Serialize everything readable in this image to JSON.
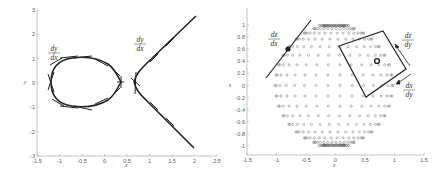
{
  "figure": {
    "left_panel": {
      "xlabel": "x",
      "ylabel": "y",
      "xticks": [
        "-1.5",
        "-1",
        "-0.5",
        "0",
        "0.5",
        "1",
        "1.5",
        "2",
        "2.5"
      ],
      "yticks": [
        "3",
        "2",
        "1",
        "0",
        "-1",
        "-2",
        "-3"
      ],
      "annotations": [
        {
          "num": "dy",
          "den": "dx",
          "position": "near closed loop"
        },
        {
          "num": "dy",
          "den": "dx",
          "position": "near open branch"
        }
      ]
    },
    "right_panel": {
      "xlabel": "x",
      "ylabel": "z",
      "xticks": [
        "-1.5",
        "-1",
        "-0.5",
        "0",
        "0.5",
        "1",
        "1.5"
      ],
      "yticks": [
        "1",
        "0.8",
        "0.6",
        "0.4",
        "0.2",
        "0",
        "-0.2",
        "-0.4",
        "-0.6",
        "-0.8",
        "-1"
      ],
      "annotations": [
        {
          "num": "dz",
          "den": "dx",
          "position": "tangent line upper-left"
        },
        {
          "num": "dz",
          "den": "dy",
          "position": "tangent plane upper-right"
        },
        {
          "num": "dx",
          "den": "dy",
          "position": "tangent plane lower-right"
        }
      ]
    }
  },
  "chart_data": [
    {
      "type": "line",
      "title": "",
      "xlabel": "x",
      "ylabel": "y",
      "xlim": [
        -1.5,
        2.5
      ],
      "ylim": [
        -3,
        3
      ],
      "grid": false,
      "description": "Elliptic-type curve with closed oval (x from about -1.15 to 0.4, y from -0.85 to 0.85) and open branch starting at x about 0.8 extending to (2.1, +/-2.7), with short tangent segments drawn along the curve",
      "series": [
        {
          "name": "closed oval",
          "x": [
            -1.15,
            -1.0,
            -0.75,
            -0.5,
            -0.25,
            0,
            0.25,
            0.4,
            0.25,
            0,
            -0.25,
            -0.5,
            -0.75,
            -1.0,
            -1.15
          ],
          "y": [
            0,
            0.55,
            0.78,
            0.82,
            0.75,
            0.6,
            0.3,
            0,
            -0.3,
            -0.6,
            -0.75,
            -0.82,
            -0.78,
            -0.55,
            0
          ]
        },
        {
          "name": "open branch upper",
          "x": [
            0.8,
            0.9,
            1.2,
            1.5,
            1.8,
            2.1
          ],
          "y": [
            0,
            0.4,
            0.95,
            1.5,
            2.1,
            2.7
          ]
        },
        {
          "name": "open branch lower",
          "x": [
            0.8,
            0.9,
            1.2,
            1.5,
            1.8,
            2.1
          ],
          "y": [
            0,
            -0.4,
            -0.95,
            -1.5,
            -2.1,
            -2.7
          ]
        }
      ],
      "annotations": [
        "dy/dx",
        "dy/dx"
      ]
    },
    {
      "type": "scatter",
      "title": "",
      "xlabel": "x",
      "ylabel": "z",
      "xlim": [
        -1.5,
        1.5
      ],
      "ylim": [
        -1.1,
        1.1
      ],
      "grid": false,
      "description": "Points on a unit sphere projected onto the x-z plane (circle markers); highlighted point near (-0.8, 0.6) with tangent line, highlighted point near (0.7, 0.4) with tangent square/plane and arrows",
      "series": [
        {
          "name": "sphere points",
          "marker": "circle",
          "extent": {
            "x": [
              -1,
              1
            ],
            "z": [
              -1,
              1
            ]
          }
        },
        {
          "name": "highlight 1",
          "x": [
            -0.8
          ],
          "y": [
            0.6
          ]
        },
        {
          "name": "highlight 2",
          "x": [
            0.7
          ],
          "y": [
            0.4
          ]
        }
      ],
      "annotations": [
        "dz/dx",
        "dz/dy",
        "dx/dy"
      ]
    }
  ]
}
